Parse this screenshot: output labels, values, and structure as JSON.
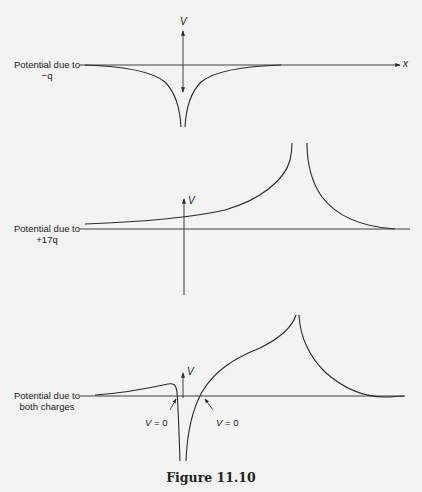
{
  "figure": {
    "caption": "Figure 11.10",
    "panels": [
      {
        "id": "minus-q",
        "label_line1": "Potential due to",
        "label_line2": "−q",
        "y_axis_label": "V",
        "x_axis_label": "x"
      },
      {
        "id": "plus-17q",
        "label_line1": "Potential due to",
        "label_line2": "+17q",
        "y_axis_label": "V"
      },
      {
        "id": "both",
        "label_line1": "Potential due to",
        "label_line2": "both charges",
        "y_axis_label": "V",
        "annotations": [
          {
            "var": "V",
            "text": " = 0"
          },
          {
            "var": "V",
            "text": " = 0"
          }
        ]
      }
    ]
  },
  "colors": {
    "background": "#f3f3f1",
    "ink": "#2a2a2a"
  }
}
